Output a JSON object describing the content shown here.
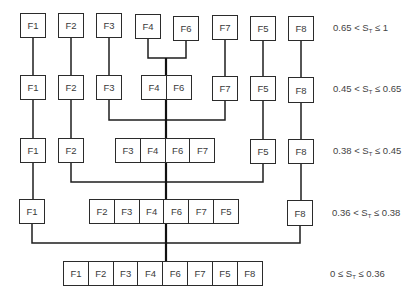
{
  "levels": [
    {
      "range": {
        "low": "0.65",
        "op1": "<",
        "var": "S",
        "sub": "T",
        "op2": "≤",
        "high": "1"
      },
      "clusters": [
        [
          "F1"
        ],
        [
          "F2"
        ],
        [
          "F3"
        ],
        [
          "F4"
        ],
        [
          "F6"
        ],
        [
          "F7"
        ],
        [
          "F5"
        ],
        [
          "F8"
        ]
      ]
    },
    {
      "range": {
        "low": "0.45",
        "op1": "<",
        "var": "S",
        "sub": "T",
        "op2": "≤",
        "high": "0.65"
      },
      "clusters": [
        [
          "F1"
        ],
        [
          "F2"
        ],
        [
          "F3"
        ],
        [
          "F4",
          "F6"
        ],
        [
          "F7"
        ],
        [
          "F5"
        ],
        [
          "F8"
        ]
      ]
    },
    {
      "range": {
        "low": "0.38",
        "op1": "<",
        "var": "S",
        "sub": "T",
        "op2": "≤",
        "high": "0.45"
      },
      "clusters": [
        [
          "F1"
        ],
        [
          "F2"
        ],
        [
          "F3",
          "F4",
          "F6",
          "F7"
        ],
        [
          "F5"
        ],
        [
          "F8"
        ]
      ]
    },
    {
      "range": {
        "low": "0.36",
        "op1": "<",
        "var": "S",
        "sub": "T",
        "op2": "≤",
        "high": "0.38"
      },
      "clusters": [
        [
          "F1"
        ],
        [
          "F2",
          "F3",
          "F4",
          "F6",
          "F7",
          "F5"
        ],
        [
          "F8"
        ]
      ]
    },
    {
      "range": {
        "low": "0",
        "op1": "≤",
        "var": "S",
        "sub": "T",
        "op2": "≤",
        "high": "0.36"
      },
      "clusters": [
        [
          "F1",
          "F2",
          "F3",
          "F4",
          "F6",
          "F7",
          "F5",
          "F8"
        ]
      ]
    }
  ],
  "colors": {
    "line": "#1e1e1e",
    "box_border": "#2b2b2b",
    "text": "#3a3a3a"
  }
}
